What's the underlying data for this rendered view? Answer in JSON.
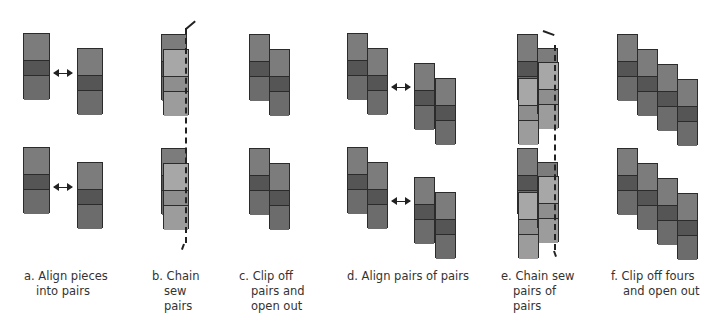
{
  "colors": {
    "top": "#7c7c7c",
    "dark": "#555555",
    "bottom": "#6c6c6c",
    "light_top": "#a7a7a7",
    "light_mid": "#8e8e8e",
    "light_bottom": "#9c9c9c",
    "outline": "#2b2b2b"
  },
  "steps": [
    {
      "id": "a",
      "caption": [
        "a. Align pieces",
        "into pairs"
      ]
    },
    {
      "id": "b",
      "caption": [
        "b. Chain",
        "sew",
        "pairs"
      ]
    },
    {
      "id": "c",
      "caption": [
        "c. Clip off",
        "pairs and",
        "open out"
      ]
    },
    {
      "id": "d",
      "caption": [
        "d. Align pairs of pairs"
      ]
    },
    {
      "id": "e",
      "caption": [
        "e. Chain sew",
        "pairs of",
        "pairs"
      ]
    },
    {
      "id": "f",
      "caption": [
        "f. Clip off fours",
        "and open out"
      ]
    }
  ],
  "diagram": {
    "rows": 2,
    "row_offset_y": 114,
    "block": {
      "segments": [
        "top",
        "dark",
        "bottom"
      ],
      "heights": [
        26,
        15,
        25
      ]
    }
  }
}
